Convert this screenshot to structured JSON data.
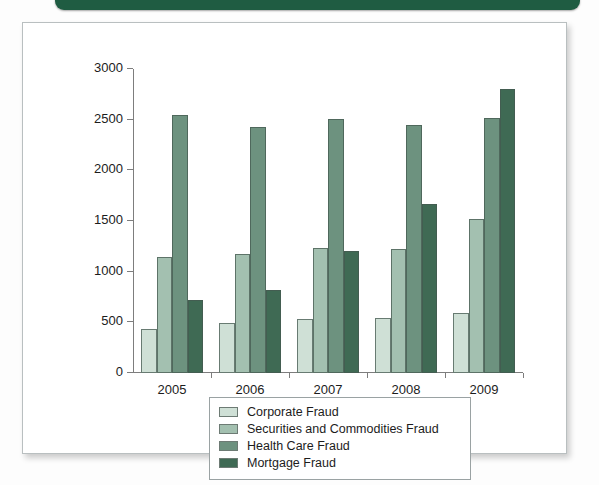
{
  "page": {
    "banner_color": "#1f5c42",
    "frame_border_color": "#b9bfc0",
    "background": "#fdfdfd"
  },
  "chart_data": {
    "type": "bar",
    "title": "",
    "subtitle": "",
    "xlabel": "",
    "ylabel": "",
    "categories": [
      "2005",
      "2006",
      "2007",
      "2008",
      "2009"
    ],
    "series": [
      {
        "name": "Corporate Fraud",
        "color": "#cfe0d6",
        "values": [
          430,
          490,
          530,
          545,
          590
        ]
      },
      {
        "name": "Securities and Commodities Fraud",
        "color": "#a3c0b0",
        "values": [
          1145,
          1170,
          1230,
          1220,
          1520
        ]
      },
      {
        "name": "Health Care Fraud",
        "color": "#6d927f",
        "values": [
          2550,
          2430,
          2505,
          2450,
          2520
        ]
      },
      {
        "name": "Mortgage Fraud",
        "color": "#3f6a54",
        "values": [
          720,
          815,
          1205,
          1665,
          2805
        ]
      }
    ],
    "ylim": [
      0,
      3000
    ],
    "yticks": [
      0,
      500,
      1000,
      1500,
      2000,
      2500,
      3000
    ],
    "ytick_labels": [
      "0",
      "500",
      "1000",
      "1500",
      "2000",
      "2500",
      "3000"
    ],
    "grid": false,
    "legend_position": "below-center",
    "legend_entries": [
      "Corporate Fraud",
      "Securities and Commodities Fraud",
      "Health Care Fraud",
      "Mortgage Fraud"
    ]
  }
}
